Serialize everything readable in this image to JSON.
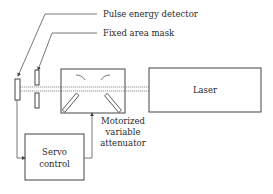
{
  "diagram": {
    "labels": {
      "pulse_energy_detector": "Pulse energy detector",
      "fixed_area_mask": "Fixed area mask",
      "laser": "Laser",
      "attenuator_line1": "Motorized",
      "attenuator_line2": "variable",
      "attenuator_line3": "attenuator",
      "servo_line1": "Servo",
      "servo_line2": "control"
    },
    "colors": {
      "line": "#555555",
      "text": "#2a2a2a",
      "background": "#ffffff"
    }
  }
}
